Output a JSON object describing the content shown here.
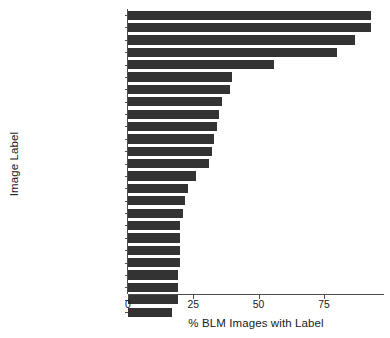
{
  "chart_data": {
    "type": "bar",
    "orientation": "horizontal",
    "title": "",
    "xlabel": "% BLM Images with Label",
    "ylabel": "Image Label",
    "categories": [
      "Person",
      "Human",
      "People",
      "Crowd",
      "Parade",
      "Clothing",
      "Face",
      "Urban",
      "Building",
      "Town",
      "City",
      "Road",
      "Poster",
      "Transportation",
      "Vehicle",
      "Text",
      "Hat",
      "Street",
      "Military",
      "Military Uniform",
      "Paper",
      "Portrait",
      "Flyer",
      "Brochure",
      "Leisure Activities"
    ],
    "values": [
      93,
      93,
      87,
      80,
      56,
      40,
      39,
      36,
      35,
      34,
      33,
      32,
      31,
      26,
      23,
      22,
      21,
      20,
      20,
      20,
      20,
      19,
      19,
      19,
      17
    ],
    "xticks": [
      0,
      25,
      50,
      75
    ],
    "xticklabels": [
      "0",
      "25",
      "50",
      "75"
    ],
    "xlim": [
      0,
      98
    ],
    "grid": false,
    "legend": null,
    "bar_color": "#333333",
    "background_color": "#ffffff",
    "axis_color": "#4d4d4d",
    "text_color": "#1a1a1a"
  }
}
